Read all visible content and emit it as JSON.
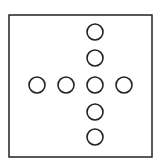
{
  "figure": {
    "width": 163,
    "height": 165,
    "background": "#ffffff",
    "stroke_color": "#222222",
    "frame": {
      "x": 9,
      "y": 15,
      "width": 143,
      "height": 142,
      "stroke_width": 1.5
    },
    "circle_radius": 8,
    "circle_stroke_width": 1.6,
    "circles": [
      {
        "name": "circle-top-1",
        "cx": 95,
        "cy": 32
      },
      {
        "name": "circle-top-2",
        "cx": 95,
        "cy": 58
      },
      {
        "name": "circle-left-1",
        "cx": 37,
        "cy": 85
      },
      {
        "name": "circle-left-2",
        "cx": 66,
        "cy": 85
      },
      {
        "name": "circle-center",
        "cx": 95,
        "cy": 85
      },
      {
        "name": "circle-right-1",
        "cx": 124,
        "cy": 85
      },
      {
        "name": "circle-bottom-1",
        "cx": 95,
        "cy": 112
      },
      {
        "name": "circle-bottom-2",
        "cx": 95,
        "cy": 137
      }
    ]
  }
}
